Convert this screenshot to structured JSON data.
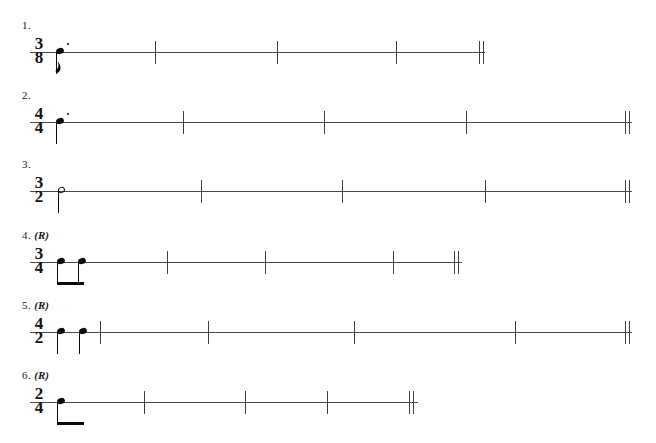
{
  "document": {
    "type": "music-rhythm-worksheet",
    "title": "",
    "background_color": "#ffffff",
    "ink_color": "#1a1a1a",
    "staff_line_color": "#444a4e",
    "width": 656,
    "height": 443
  },
  "exercises": [
    {
      "index": 1,
      "number_label": "1.",
      "rhythm_tag": "",
      "time_signature": {
        "numerator": "3",
        "denominator": "8",
        "text": "3/8"
      },
      "line": {
        "x": 30,
        "y": 52,
        "width": 455
      },
      "notes": [
        {
          "kind": "eighth-note-dotted",
          "x": 56,
          "notehead": "filled",
          "stem_direction": "down",
          "flag": true,
          "dotted": true
        }
      ],
      "barlines": [
        155,
        277,
        396
      ],
      "double_barline": 479
    },
    {
      "index": 2,
      "number_label": "2.",
      "rhythm_tag": "",
      "time_signature": {
        "numerator": "4",
        "denominator": "4",
        "text": "4/4"
      },
      "line": {
        "x": 30,
        "y": 122,
        "width": 602
      },
      "notes": [
        {
          "kind": "quarter-note-dotted",
          "x": 56,
          "notehead": "filled",
          "stem_direction": "down",
          "flag": false,
          "dotted": true
        }
      ],
      "barlines": [
        183,
        324,
        466
      ],
      "double_barline": 625
    },
    {
      "index": 3,
      "number_label": "3.",
      "rhythm_tag": "",
      "time_signature": {
        "numerator": "3",
        "denominator": "2",
        "text": "3/2"
      },
      "line": {
        "x": 30,
        "y": 191,
        "width": 602
      },
      "notes": [
        {
          "kind": "half-note",
          "x": 58,
          "notehead": "open",
          "stem_direction": "down",
          "flag": false,
          "dotted": false
        }
      ],
      "barlines": [
        201,
        342,
        485
      ],
      "double_barline": 625
    },
    {
      "index": 4,
      "number_label": "4.",
      "rhythm_tag": "(R)",
      "time_signature": {
        "numerator": "3",
        "denominator": "4",
        "text": "3/4"
      },
      "line": {
        "x": 30,
        "y": 262,
        "width": 432
      },
      "notes": [
        {
          "kind": "eighth-note-beamed",
          "x": 57,
          "notehead": "filled",
          "stem_direction": "down",
          "flag": false,
          "dotted": false
        },
        {
          "kind": "eighth-note-beamed",
          "x": 78,
          "notehead": "filled",
          "stem_direction": "down",
          "flag": false,
          "dotted": false
        }
      ],
      "beam": {
        "x": 57,
        "width": 27
      },
      "barlines": [
        167,
        265,
        393
      ],
      "double_barline": 454
    },
    {
      "index": 5,
      "number_label": "5.",
      "rhythm_tag": "(R)",
      "time_signature": {
        "numerator": "4",
        "denominator": "2",
        "text": "4/2"
      },
      "line": {
        "x": 30,
        "y": 332,
        "width": 602
      },
      "notes": [
        {
          "kind": "quarter-note",
          "x": 57,
          "notehead": "filled",
          "stem_direction": "down",
          "flag": false,
          "dotted": false
        },
        {
          "kind": "quarter-note",
          "x": 79,
          "notehead": "filled",
          "stem_direction": "down",
          "flag": false,
          "dotted": false
        }
      ],
      "barlines": [
        100,
        208,
        354,
        515
      ],
      "double_barline": 625
    },
    {
      "index": 6,
      "number_label": "6.",
      "rhythm_tag": "(R)",
      "time_signature": {
        "numerator": "2",
        "denominator": "4",
        "text": "2/4"
      },
      "line": {
        "x": 30,
        "y": 402,
        "width": 388
      },
      "notes": [
        {
          "kind": "eighth-note-beamed",
          "x": 57,
          "notehead": "filled",
          "stem_direction": "down",
          "flag": false,
          "dotted": false
        }
      ],
      "beam": {
        "x": 57,
        "width": 27
      },
      "barlines": [
        144,
        245,
        327
      ],
      "double_barline": 409
    }
  ]
}
